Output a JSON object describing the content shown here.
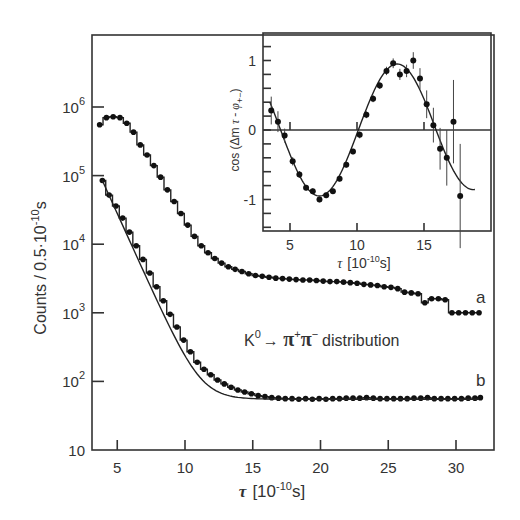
{
  "chart_data": [
    {
      "id": "main",
      "type": "scatter",
      "title": "",
      "xlabel": "τ [10⁻¹⁰s]",
      "ylabel": "Counts / 0.5·10⁻¹⁰s",
      "xscale": "linear",
      "yscale": "log",
      "xlim": [
        3.3,
        32.8
      ],
      "ylim": [
        10,
        7000000
      ],
      "xticks": [
        5,
        10,
        15,
        20,
        25,
        30
      ],
      "yticks": [
        10,
        100,
        1000,
        10000,
        100000,
        1000000
      ],
      "ytick_labels": [
        "10",
        "10²",
        "10³",
        "10⁴",
        "10⁵",
        "10⁶"
      ],
      "grid": false,
      "annotation": "K⁰→ π⁺π⁻ distribution",
      "series": [
        {
          "name": "a",
          "label": "a",
          "points": [
            [
              3.7,
              550000
            ],
            [
              4.2,
              700000
            ],
            [
              4.7,
              720000
            ],
            [
              5.2,
              700000
            ],
            [
              5.7,
              580000
            ],
            [
              6.2,
              430000
            ],
            [
              6.7,
              280000
            ],
            [
              7.2,
              200000
            ],
            [
              7.7,
              140000
            ],
            [
              8.2,
              95000
            ],
            [
              8.7,
              62000
            ],
            [
              9.2,
              42000
            ],
            [
              9.7,
              28000
            ],
            [
              10.2,
              19000
            ],
            [
              10.7,
              13000
            ],
            [
              11.2,
              9500
            ],
            [
              11.7,
              7500
            ],
            [
              12.2,
              6200
            ],
            [
              12.7,
              5300
            ],
            [
              13.2,
              4700
            ],
            [
              13.7,
              4300
            ],
            [
              14.2,
              4000
            ],
            [
              14.7,
              3700
            ],
            [
              15.2,
              3500
            ],
            [
              15.7,
              3400
            ],
            [
              16.2,
              3300
            ],
            [
              16.7,
              3200
            ],
            [
              17.2,
              3150
            ],
            [
              17.7,
              3100
            ],
            [
              18.2,
              3050
            ],
            [
              18.7,
              3000
            ],
            [
              19.2,
              3000
            ],
            [
              19.7,
              2950
            ],
            [
              20.2,
              2900
            ],
            [
              20.7,
              2850
            ],
            [
              21.2,
              2850
            ],
            [
              21.7,
              2800
            ],
            [
              22.2,
              2750
            ],
            [
              22.7,
              2700
            ],
            [
              23.2,
              2600
            ],
            [
              23.7,
              2550
            ],
            [
              24.2,
              2500
            ],
            [
              24.7,
              2400
            ],
            [
              25.2,
              2350
            ],
            [
              25.7,
              2250
            ],
            [
              26.2,
              2000
            ],
            [
              26.7,
              1950
            ],
            [
              27.2,
              1900
            ],
            [
              27.7,
              1400
            ],
            [
              28.2,
              1600
            ],
            [
              28.7,
              1600
            ],
            [
              29.2,
              1550
            ],
            [
              29.7,
              1000
            ],
            [
              30.2,
              1000
            ],
            [
              30.7,
              1000
            ],
            [
              31.2,
              1000
            ],
            [
              31.7,
              1000
            ]
          ]
        },
        {
          "name": "b",
          "label": "b",
          "points": [
            [
              3.9,
              85000
            ],
            [
              4.4,
              52000
            ],
            [
              4.9,
              36000
            ],
            [
              5.4,
              24000
            ],
            [
              5.9,
              15000
            ],
            [
              6.4,
              9500
            ],
            [
              6.9,
              6000
            ],
            [
              7.4,
              3800
            ],
            [
              7.9,
              2400
            ],
            [
              8.4,
              1500
            ],
            [
              8.9,
              950
            ],
            [
              9.4,
              620
            ],
            [
              9.9,
              400
            ],
            [
              10.4,
              270
            ],
            [
              10.9,
              190
            ],
            [
              11.4,
              150
            ],
            [
              11.9,
              125
            ],
            [
              12.4,
              105
            ],
            [
              12.9,
              92
            ],
            [
              13.4,
              82
            ],
            [
              13.9,
              75
            ],
            [
              14.4,
              70
            ],
            [
              14.9,
              66
            ],
            [
              15.4,
              62
            ],
            [
              15.9,
              60
            ],
            [
              16.4,
              58
            ],
            [
              16.9,
              57
            ],
            [
              17.4,
              56
            ],
            [
              17.9,
              56
            ],
            [
              18.4,
              55
            ],
            [
              18.9,
              56
            ],
            [
              19.4,
              55
            ],
            [
              19.9,
              56
            ],
            [
              20.4,
              55
            ],
            [
              20.9,
              56
            ],
            [
              21.4,
              56
            ],
            [
              21.9,
              57
            ],
            [
              22.4,
              57
            ],
            [
              22.9,
              57
            ],
            [
              23.4,
              58
            ],
            [
              23.9,
              57
            ],
            [
              24.4,
              56
            ],
            [
              24.9,
              56
            ],
            [
              25.4,
              56
            ],
            [
              25.9,
              56
            ],
            [
              26.4,
              56
            ],
            [
              26.9,
              57
            ],
            [
              27.4,
              57
            ],
            [
              27.9,
              58
            ],
            [
              28.4,
              56
            ],
            [
              28.9,
              56
            ],
            [
              29.4,
              56
            ],
            [
              29.9,
              56
            ],
            [
              30.4,
              56
            ],
            [
              30.9,
              57
            ],
            [
              31.4,
              57
            ],
            [
              31.8,
              58
            ]
          ]
        }
      ],
      "legend": {
        "visible": false,
        "series_labels": [
          "a",
          "b"
        ]
      }
    },
    {
      "id": "inset",
      "type": "scatter",
      "title": "",
      "xlabel": "τ [10⁻¹⁰s]",
      "ylabel": "cos(Δm τ - φ₊₋)",
      "xlim": [
        3.0,
        19.9
      ],
      "ylim": [
        -1.5,
        1.4
      ],
      "xticks": [
        5,
        10,
        15
      ],
      "yticks": [
        -1,
        0,
        1
      ],
      "grid": false,
      "reference_line_y": 0,
      "series": [
        {
          "name": "data",
          "points": [
            [
              3.6,
              0.28,
              0.2
            ],
            [
              4.1,
              0.12,
              0.15
            ],
            [
              4.6,
              -0.08,
              0.1
            ],
            [
              5.2,
              -0.45,
              0.06
            ],
            [
              5.7,
              -0.64,
              0.05
            ],
            [
              6.2,
              -0.83,
              0.04
            ],
            [
              6.7,
              -0.88,
              0.04
            ],
            [
              7.2,
              -1.0,
              0.04
            ],
            [
              7.7,
              -0.94,
              0.04
            ],
            [
              8.2,
              -0.88,
              0.04
            ],
            [
              8.7,
              -0.7,
              0.04
            ],
            [
              9.2,
              -0.5,
              0.04
            ],
            [
              9.7,
              -0.31,
              0.04
            ],
            [
              10.2,
              -0.07,
              0.05
            ],
            [
              10.7,
              0.22,
              0.05
            ],
            [
              11.2,
              0.45,
              0.05
            ],
            [
              11.7,
              0.64,
              0.05
            ],
            [
              12.2,
              0.85,
              0.06
            ],
            [
              12.7,
              0.96,
              0.07
            ],
            [
              13.2,
              0.8,
              0.08
            ],
            [
              13.7,
              0.85,
              0.09
            ],
            [
              14.2,
              1.0,
              0.12
            ],
            [
              14.7,
              0.74,
              0.15
            ],
            [
              15.2,
              0.37,
              0.2
            ],
            [
              15.7,
              0.07,
              0.25
            ],
            [
              16.2,
              -0.27,
              0.3
            ],
            [
              16.7,
              -0.4,
              0.4
            ],
            [
              17.2,
              0.12,
              0.6
            ],
            [
              17.7,
              -0.95,
              0.75
            ]
          ]
        },
        {
          "name": "fit",
          "type": "line",
          "description": "cos(Δm·τ − φ) fit curve, period ≈ 11.5, peak ≈ 13"
        }
      ]
    }
  ]
}
